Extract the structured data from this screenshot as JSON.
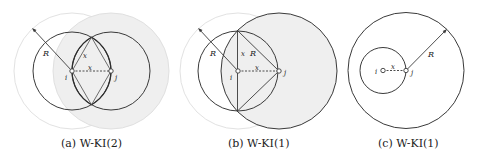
{
  "figure": {
    "panels": [
      {
        "id": "a",
        "caption": "(a) W-KI(2)",
        "labels": {
          "R": "R",
          "x_side": "x",
          "x_base": "x",
          "i": "i",
          "j": "j"
        }
      },
      {
        "id": "b",
        "caption": "(b) W-KI(1)",
        "labels": {
          "R_left": "R",
          "R_right": "R",
          "x_side": "x",
          "x_base": "x",
          "i": "i",
          "j": "j"
        }
      },
      {
        "id": "c",
        "caption": "(c) W-KI(1)",
        "labels": {
          "R": "R",
          "x": "x",
          "i": "i",
          "j": "j"
        }
      }
    ],
    "colors": {
      "stroke_dark": "#3a3a3a",
      "stroke_faint": "#d8d8d8",
      "fill_shade": "#eeeeee",
      "node_fill": "#ffffff"
    }
  }
}
